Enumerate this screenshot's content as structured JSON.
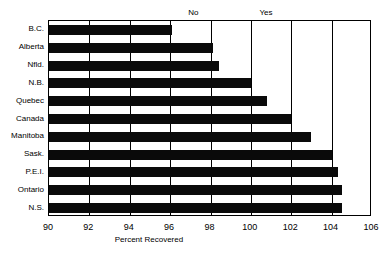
{
  "chart_data": {
    "type": "bar",
    "orientation": "horizontal",
    "title": "",
    "xlabel": "Percent Recovered",
    "ylabel": "",
    "xlim": [
      90,
      106
    ],
    "ylim": null,
    "grid": true,
    "gridlines_x": [
      90,
      92,
      94,
      96,
      98,
      100,
      102,
      104,
      106
    ],
    "xticks": [
      "90",
      "92",
      "94",
      "96",
      "98",
      "100",
      "102",
      "104",
      "106"
    ],
    "xtick_values": [
      90,
      92,
      94,
      96,
      98,
      100,
      102,
      104,
      106
    ],
    "legend": null,
    "legend_position": "none",
    "categories": [
      "B.C.",
      "Alberta",
      "Nfld.",
      "N.B.",
      "Quebec",
      "Canada",
      "Manitoba",
      "Sask.",
      "P.E.I.",
      "Ontario",
      "N.S."
    ],
    "values": [
      96.1,
      98.1,
      98.4,
      100.0,
      100.8,
      102.0,
      103.0,
      104.0,
      104.3,
      104.5,
      104.5
    ],
    "bar_color": "#0a0a0a",
    "annotations": [
      {
        "text": "No",
        "x": 97.2,
        "position": "above-plot"
      },
      {
        "text": "Yes",
        "x": 100.8,
        "position": "above-plot"
      }
    ]
  },
  "axis": {
    "x_axis_label": "Percent Recovered"
  }
}
